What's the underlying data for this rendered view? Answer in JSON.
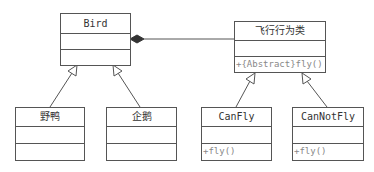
{
  "diagram": {
    "type": "UML class diagram",
    "classes": [
      {
        "id": "bird",
        "name": "Bird",
        "attributes": [],
        "operations": []
      },
      {
        "id": "fly_behavior",
        "name": "飞行行为类",
        "attributes": [],
        "operations": [
          "+{Abstract}fly()"
        ]
      },
      {
        "id": "wild_duck",
        "name": "野鸭",
        "attributes": [],
        "operations": []
      },
      {
        "id": "penguin",
        "name": "企鹅",
        "attributes": [],
        "operations": []
      },
      {
        "id": "can_fly",
        "name": "CanFly",
        "attributes": [],
        "operations": [
          "+fly()"
        ]
      },
      {
        "id": "can_not_fly",
        "name": "CanNotFly",
        "attributes": [],
        "operations": [
          "+fly()"
        ]
      }
    ],
    "relationships": [
      {
        "type": "composition",
        "from": "bird",
        "to": "fly_behavior",
        "diamond_at": "bird"
      },
      {
        "type": "generalization",
        "child": "wild_duck",
        "parent": "bird"
      },
      {
        "type": "generalization",
        "child": "penguin",
        "parent": "bird"
      },
      {
        "type": "generalization",
        "child": "can_fly",
        "parent": "fly_behavior"
      },
      {
        "type": "generalization",
        "child": "can_not_fly",
        "parent": "fly_behavior"
      }
    ],
    "colors": {
      "line": "#555555",
      "text": "#333333",
      "operation_text": "#888888",
      "diamond": "#333333"
    }
  }
}
